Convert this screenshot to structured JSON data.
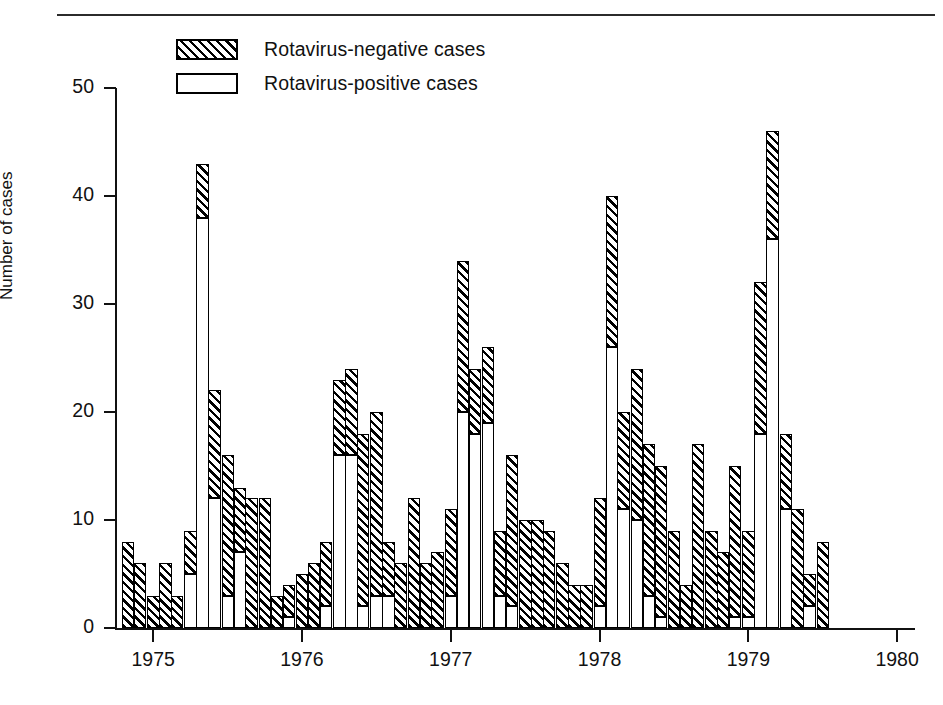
{
  "figure": {
    "legend": [
      {
        "key": "negative",
        "label": "Rotavirus-negative cases",
        "style": "hatched"
      },
      {
        "key": "positive",
        "label": "Rotavirus-positive cases",
        "style": "open"
      }
    ]
  },
  "chart_data": {
    "type": "bar",
    "subtype": "stacked-bar-monthly-timeseries",
    "title": "",
    "xlabel": "",
    "ylabel": "Number of cases",
    "ylim": [
      0,
      50
    ],
    "yticks": [
      0,
      10,
      20,
      30,
      40,
      50
    ],
    "ytick_labels": [
      "0",
      "10",
      "20",
      "30",
      "40",
      "50"
    ],
    "xtick_labels": [
      "1975",
      "1976",
      "1977",
      "1978",
      "1979",
      "1980"
    ],
    "xtick_values": [
      1975,
      1976,
      1977,
      1978,
      1979,
      1980
    ],
    "grid": false,
    "legend_position": "top-left",
    "x_start": 1974.75,
    "x_end": 1980.1,
    "months_per_tick": 12,
    "series": [
      {
        "name": "Rotavirus-positive cases",
        "key": "positive",
        "style": "open"
      },
      {
        "name": "Rotavirus-negative cases",
        "key": "negative",
        "style": "hatched"
      }
    ],
    "bars": [
      {
        "x": 1974.79,
        "total": 8,
        "positive": 0,
        "negative": 8
      },
      {
        "x": 1974.87,
        "total": 6,
        "positive": 0,
        "negative": 6
      },
      {
        "x": 1974.96,
        "total": 3,
        "positive": 0,
        "negative": 3
      },
      {
        "x": 1975.04,
        "total": 6,
        "positive": 0,
        "negative": 6
      },
      {
        "x": 1975.12,
        "total": 3,
        "positive": 0,
        "negative": 3
      },
      {
        "x": 1975.21,
        "total": 9,
        "positive": 5,
        "negative": 4
      },
      {
        "x": 1975.29,
        "total": 43,
        "positive": 38,
        "negative": 5
      },
      {
        "x": 1975.37,
        "total": 22,
        "positive": 12,
        "negative": 10
      },
      {
        "x": 1975.46,
        "total": 16,
        "positive": 3,
        "negative": 13
      },
      {
        "x": 1975.54,
        "total": 13,
        "positive": 7,
        "negative": 6
      },
      {
        "x": 1975.62,
        "total": 12,
        "positive": 0,
        "negative": 12
      },
      {
        "x": 1975.71,
        "total": 12,
        "positive": 0,
        "negative": 12
      },
      {
        "x": 1975.79,
        "total": 3,
        "positive": 0,
        "negative": 3
      },
      {
        "x": 1975.87,
        "total": 4,
        "positive": 1,
        "negative": 3
      },
      {
        "x": 1975.96,
        "total": 5,
        "positive": 0,
        "negative": 5
      },
      {
        "x": 1976.04,
        "total": 6,
        "positive": 0,
        "negative": 6
      },
      {
        "x": 1976.12,
        "total": 8,
        "positive": 2,
        "negative": 6
      },
      {
        "x": 1976.21,
        "total": 23,
        "positive": 16,
        "negative": 7
      },
      {
        "x": 1976.29,
        "total": 24,
        "positive": 16,
        "negative": 8
      },
      {
        "x": 1976.37,
        "total": 18,
        "positive": 2,
        "negative": 16
      },
      {
        "x": 1976.46,
        "total": 20,
        "positive": 3,
        "negative": 17
      },
      {
        "x": 1976.54,
        "total": 8,
        "positive": 3,
        "negative": 5
      },
      {
        "x": 1976.62,
        "total": 6,
        "positive": 0,
        "negative": 6
      },
      {
        "x": 1976.71,
        "total": 12,
        "positive": 0,
        "negative": 12
      },
      {
        "x": 1976.79,
        "total": 6,
        "positive": 0,
        "negative": 6
      },
      {
        "x": 1976.87,
        "total": 7,
        "positive": 0,
        "negative": 7
      },
      {
        "x": 1976.96,
        "total": 11,
        "positive": 3,
        "negative": 8
      },
      {
        "x": 1977.04,
        "total": 34,
        "positive": 20,
        "negative": 14
      },
      {
        "x": 1977.12,
        "total": 24,
        "positive": 18,
        "negative": 6
      },
      {
        "x": 1977.21,
        "total": 26,
        "positive": 19,
        "negative": 7
      },
      {
        "x": 1977.29,
        "total": 9,
        "positive": 3,
        "negative": 6
      },
      {
        "x": 1977.37,
        "total": 16,
        "positive": 2,
        "negative": 14
      },
      {
        "x": 1977.46,
        "total": 10,
        "positive": 0,
        "negative": 10
      },
      {
        "x": 1977.54,
        "total": 10,
        "positive": 0,
        "negative": 10
      },
      {
        "x": 1977.62,
        "total": 9,
        "positive": 0,
        "negative": 9
      },
      {
        "x": 1977.71,
        "total": 6,
        "positive": 0,
        "negative": 6
      },
      {
        "x": 1977.79,
        "total": 4,
        "positive": 0,
        "negative": 4
      },
      {
        "x": 1977.87,
        "total": 4,
        "positive": 0,
        "negative": 4
      },
      {
        "x": 1977.96,
        "total": 12,
        "positive": 2,
        "negative": 10
      },
      {
        "x": 1978.04,
        "total": 40,
        "positive": 26,
        "negative": 14
      },
      {
        "x": 1978.12,
        "total": 20,
        "positive": 11,
        "negative": 9
      },
      {
        "x": 1978.21,
        "total": 24,
        "positive": 10,
        "negative": 14
      },
      {
        "x": 1978.29,
        "total": 17,
        "positive": 3,
        "negative": 14
      },
      {
        "x": 1978.37,
        "total": 15,
        "positive": 1,
        "negative": 14
      },
      {
        "x": 1978.46,
        "total": 9,
        "positive": 0,
        "negative": 9
      },
      {
        "x": 1978.54,
        "total": 4,
        "positive": 0,
        "negative": 4
      },
      {
        "x": 1978.62,
        "total": 17,
        "positive": 0,
        "negative": 17
      },
      {
        "x": 1978.71,
        "total": 9,
        "positive": 0,
        "negative": 9
      },
      {
        "x": 1978.79,
        "total": 7,
        "positive": 0,
        "negative": 7
      },
      {
        "x": 1978.87,
        "total": 15,
        "positive": 1,
        "negative": 14
      },
      {
        "x": 1978.96,
        "total": 9,
        "positive": 1,
        "negative": 8
      },
      {
        "x": 1979.04,
        "total": 32,
        "positive": 18,
        "negative": 14
      },
      {
        "x": 1979.12,
        "total": 46,
        "positive": 36,
        "negative": 10
      },
      {
        "x": 1979.21,
        "total": 18,
        "positive": 11,
        "negative": 7
      },
      {
        "x": 1979.29,
        "total": 11,
        "positive": 0,
        "negative": 11
      },
      {
        "x": 1979.37,
        "total": 5,
        "positive": 2,
        "negative": 3
      },
      {
        "x": 1979.46,
        "total": 8,
        "positive": 0,
        "negative": 8
      }
    ]
  }
}
